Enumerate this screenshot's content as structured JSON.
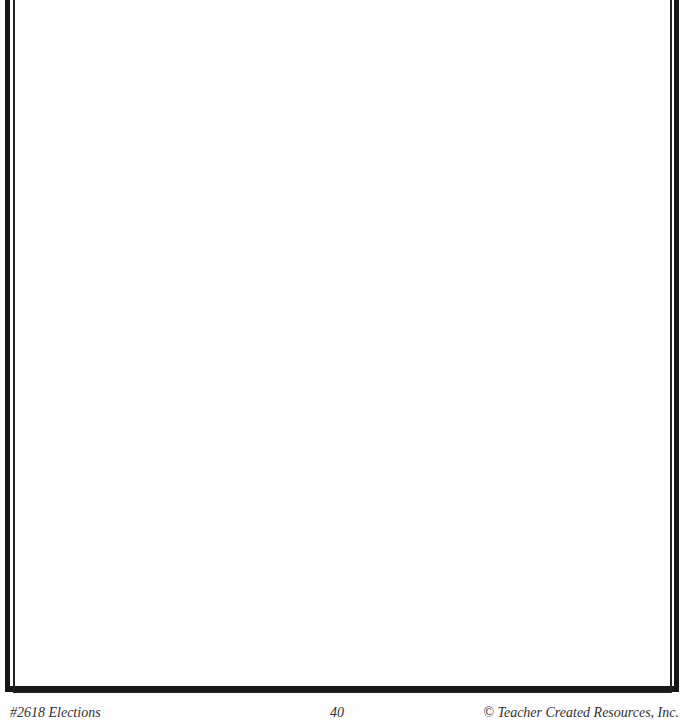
{
  "page": {
    "type": "worksheet-page",
    "content": "",
    "border_color": "#161616"
  },
  "footer": {
    "left": "#2618 Elections",
    "center": "40",
    "right": "© Teacher Created Resources, Inc."
  }
}
